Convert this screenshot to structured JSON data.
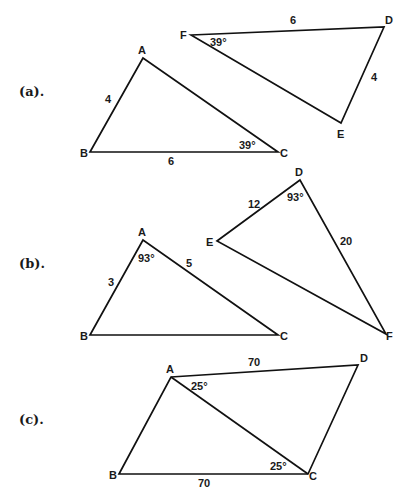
{
  "sections": [
    {
      "label": "(a).",
      "figures": [
        {
          "name": "triangle-ABC",
          "vertices": {
            "A": [
              143,
              58
            ],
            "B": [
              90,
              152
            ],
            "C": [
              278,
              152
            ]
          },
          "measures": [
            {
              "text": "4",
              "kind": "side",
              "side": "AB"
            },
            {
              "text": "6",
              "kind": "side",
              "side": "BC"
            },
            {
              "text": "39°",
              "kind": "angle",
              "at": "C"
            }
          ]
        },
        {
          "name": "triangle-DEF",
          "vertices": {
            "F": [
              191,
              35
            ],
            "D": [
              384,
              27
            ],
            "E": [
              341,
              123
            ]
          },
          "measures": [
            {
              "text": "6",
              "kind": "side",
              "side": "FD"
            },
            {
              "text": "4",
              "kind": "side",
              "side": "DE"
            },
            {
              "text": "39°",
              "kind": "angle",
              "at": "F"
            }
          ]
        }
      ]
    },
    {
      "label": "(b).",
      "figures": [
        {
          "name": "triangle-ABC",
          "vertices": {
            "A": [
              143,
              240
            ],
            "B": [
              90,
              335
            ],
            "C": [
              278,
              335
            ]
          },
          "measures": [
            {
              "text": "3",
              "kind": "side",
              "side": "AB"
            },
            {
              "text": "5",
              "kind": "side",
              "side": "AC"
            },
            {
              "text": "93°",
              "kind": "angle",
              "at": "A"
            }
          ]
        },
        {
          "name": "triangle-DEF",
          "vertices": {
            "D": [
              300,
              180
            ],
            "E": [
              217,
              241
            ],
            "F": [
              386,
              334
            ]
          },
          "measures": [
            {
              "text": "12",
              "kind": "side",
              "side": "DE"
            },
            {
              "text": "20",
              "kind": "side",
              "side": "DF"
            },
            {
              "text": "93°",
              "kind": "angle",
              "at": "D"
            }
          ]
        }
      ]
    },
    {
      "label": "(c).",
      "figures": [
        {
          "name": "quadrilateral-ABCD-with-diagonal-AC",
          "vertices": {
            "A": [
              171,
              377
            ],
            "B": [
              119,
              474
            ],
            "C": [
              308,
              474
            ],
            "D": [
              358,
              365
            ]
          },
          "measures": [
            {
              "text": "70",
              "kind": "side",
              "side": "AD"
            },
            {
              "text": "70",
              "kind": "side",
              "side": "BC"
            },
            {
              "text": "25°",
              "kind": "angle",
              "at": "A",
              "between": "AD-AC"
            },
            {
              "text": "25°",
              "kind": "angle",
              "at": "C",
              "between": "CB-CA"
            }
          ]
        }
      ]
    }
  ],
  "text": {
    "a_label": "(a).",
    "b_label": "(b).",
    "c_label": "(c).",
    "a": {
      "t1": {
        "A": "A",
        "B": "B",
        "C": "C",
        "AB": "4",
        "BC": "6",
        "angC": "39°"
      },
      "t2": {
        "F": "F",
        "D": "D",
        "E": "E",
        "FD": "6",
        "DE": "4",
        "angF": "39°"
      }
    },
    "b": {
      "t1": {
        "A": "A",
        "B": "B",
        "C": "C",
        "AB": "3",
        "AC": "5",
        "angA": "93°"
      },
      "t2": {
        "D": "D",
        "E": "E",
        "F": "F",
        "DE": "12",
        "DF": "20",
        "angD": "93°"
      }
    },
    "c": {
      "A": "A",
      "B": "B",
      "C": "C",
      "D": "D",
      "AD": "70",
      "BC": "70",
      "angA": "25°",
      "angC": "25°"
    }
  },
  "colors": {
    "stroke": "#111111",
    "text": "#1a1a1a",
    "background": "#ffffff"
  }
}
